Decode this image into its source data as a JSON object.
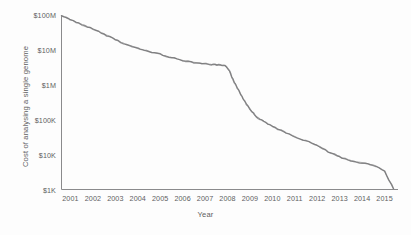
{
  "chart_data": {
    "type": "line",
    "title": "",
    "xlabel": "Year",
    "ylabel": "Cost of analysing a single genome",
    "grid": false,
    "legend": false,
    "y_scale": "log",
    "ylim": [
      1000,
      100000000
    ],
    "xlim": [
      2000.6,
      2015.6
    ],
    "ytick_labels": [
      "$100M",
      "$10M",
      "$1M",
      "$100K",
      "$10K",
      "$1K"
    ],
    "ytick_values": [
      100000000,
      10000000,
      1000000,
      100000,
      10000,
      1000
    ],
    "xtick_labels": [
      "2001",
      "2002",
      "2003",
      "2004",
      "2005",
      "2006",
      "2007",
      "2008",
      "2009",
      "2010",
      "2011",
      "2012",
      "2013",
      "2014",
      "2015"
    ],
    "xtick_values": [
      2001,
      2002,
      2003,
      2004,
      2005,
      2006,
      2007,
      2008,
      2009,
      2010,
      2011,
      2012,
      2013,
      2014,
      2015
    ],
    "line_color": "#8e8e90",
    "axis_color": "#8a8a8c",
    "series": [
      {
        "name": "Cost per genome",
        "x": [
          2000.6,
          2001.0,
          2001.5,
          2002.0,
          2002.5,
          2003.0,
          2003.5,
          2004.0,
          2004.5,
          2005.0,
          2005.5,
          2006.0,
          2006.5,
          2007.0,
          2007.3,
          2007.6,
          2007.9,
          2008.1,
          2008.3,
          2008.5,
          2008.7,
          2009.0,
          2009.3,
          2009.6,
          2010.0,
          2010.5,
          2011.0,
          2011.5,
          2012.0,
          2012.5,
          2013.0,
          2013.5,
          2014.0,
          2014.5,
          2015.0,
          2015.4
        ],
        "y": [
          95000000,
          75000000,
          52000000,
          40000000,
          28000000,
          20000000,
          14000000,
          11000000,
          9000000,
          7500000,
          6000000,
          5000000,
          4400000,
          4000000,
          3800000,
          3700000,
          3500000,
          2400000,
          1200000,
          700000,
          400000,
          200000,
          120000,
          90000,
          65000,
          45000,
          32000,
          25000,
          18000,
          12000,
          8500,
          6500,
          5800,
          5000,
          3400,
          1050
        ]
      }
    ]
  },
  "axes": {
    "y_title": "Cost of analysing a single genome",
    "x_title": "Year"
  }
}
